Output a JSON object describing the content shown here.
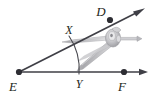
{
  "figure": {
    "kind": "geometry-construction-diagram",
    "background_color": "#ffffff",
    "stroke_color": "#3f3f46",
    "label_color": "#231f20",
    "compass_color": "#b9b9bc",
    "points": [
      {
        "id": "E",
        "label": "E",
        "x": 19,
        "y": 72,
        "dot": true,
        "label_x": 13,
        "label_y": 88
      },
      {
        "id": "D",
        "label": "D",
        "x": 110,
        "y": 20,
        "dot": true,
        "label_x": 99,
        "label_y": 15
      },
      {
        "id": "F",
        "label": "F",
        "x": 124,
        "y": 72,
        "dot": true,
        "label_x": 120,
        "label_y": 88
      },
      {
        "id": "X",
        "label": "X",
        "x": 70,
        "y": 38,
        "dot": false,
        "label_x": 65,
        "label_y": 32
      },
      {
        "id": "Y",
        "label": "Y",
        "x": 78,
        "y": 72,
        "dot": false,
        "label_x": 76,
        "label_y": 86
      }
    ],
    "rays": [
      {
        "id": "ray-ED",
        "from": "E",
        "through": "D",
        "tip_x": 144,
        "tip_y": 9,
        "arrow": true
      },
      {
        "id": "ray-EF",
        "from": "E",
        "through": "F",
        "tip_x": 147,
        "tip_y": 72,
        "arrow": true
      }
    ],
    "arc": {
      "id": "arc-XY",
      "center": "E",
      "from_x": 69,
      "from_y": 36,
      "to_x": 79,
      "to_y": 74,
      "radius": 59
    },
    "tool": {
      "name": "compass",
      "pivot_x": 112,
      "pivot_y": 38,
      "screw_tip_x": 141,
      "screw_tip_y": 40
    }
  }
}
